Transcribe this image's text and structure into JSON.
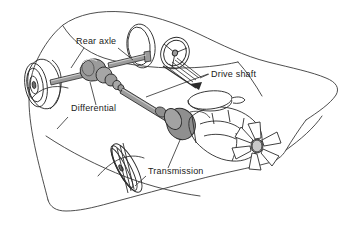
{
  "figure": {
    "style": "line-art technical illustration",
    "background_color": "#ffffff",
    "line_color": "#2b2b2b",
    "body_outline_color": "#3a3a3a",
    "part_fill_color": "#9b9b9b",
    "part_fill_light": "#c9c9c9",
    "text_color": "#1a1a1a"
  },
  "labels": [
    {
      "id": "rear-axle",
      "text": "Rear axle",
      "x": 76,
      "y": 44
    },
    {
      "id": "differential",
      "text": "Differential",
      "x": 71,
      "y": 111
    },
    {
      "id": "drive-shaft",
      "text": "Drive shaft",
      "x": 211,
      "y": 77
    },
    {
      "id": "transmission",
      "text": "Transmission",
      "x": 148,
      "y": 174
    }
  ],
  "parts": [
    {
      "id": "car-body",
      "name": "car body outline"
    },
    {
      "id": "rear-wheel-near",
      "name": "near rear wheel"
    },
    {
      "id": "rear-wheel-far",
      "name": "far rear wheel"
    },
    {
      "id": "front-wheel",
      "name": "front wheel"
    },
    {
      "id": "rear-axle",
      "name": "rear axle shaft"
    },
    {
      "id": "differential",
      "name": "differential housing"
    },
    {
      "id": "drive-shaft",
      "name": "drive shaft"
    },
    {
      "id": "transmission",
      "name": "transmission bell housing"
    },
    {
      "id": "engine-block",
      "name": "engine block"
    },
    {
      "id": "air-cleaner",
      "name": "air cleaner"
    },
    {
      "id": "cooling-fan",
      "name": "engine cooling fan"
    },
    {
      "id": "steering-wheel",
      "name": "steering wheel"
    },
    {
      "id": "steering-column",
      "name": "steering column"
    }
  ]
}
